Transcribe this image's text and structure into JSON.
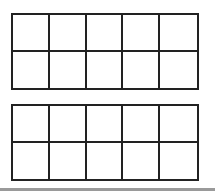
{
  "figure": {
    "type": "ten-frames",
    "frames": [
      {
        "rows": 2,
        "columns": 5,
        "filled_cells": 0
      },
      {
        "rows": 2,
        "columns": 5,
        "filled_cells": 0
      }
    ],
    "colors": {
      "line": "#222222",
      "background": "#ffffff",
      "bottom_rule": "#9a9a9a"
    }
  }
}
